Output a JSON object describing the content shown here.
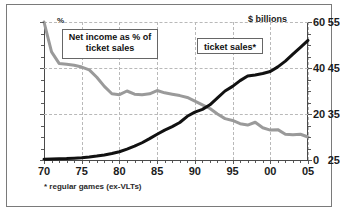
{
  "chart_data": {
    "type": "line",
    "title": "",
    "xlabel": "",
    "ylabel": "%",
    "y2label": "$ billions",
    "footnote": "* regular games (ex-VLTs)",
    "unit_left": "%",
    "unit_right": "$ billions",
    "grid": true,
    "legend_position": "inline-callouts",
    "x": [
      1970,
      1971,
      1972,
      1973,
      1974,
      1975,
      1976,
      1977,
      1978,
      1979,
      1980,
      1981,
      1982,
      1983,
      1984,
      1985,
      1986,
      1987,
      1988,
      1989,
      1990,
      1991,
      1992,
      1993,
      1994,
      1995,
      1996,
      1997,
      1998,
      1999,
      2000,
      2001,
      2002,
      2003,
      2004,
      2005
    ],
    "xtick_values": [
      1970,
      1975,
      1980,
      1985,
      1990,
      1995,
      2000,
      2005
    ],
    "xtick_labels": [
      "70",
      "75",
      "80",
      "85",
      "90",
      "95",
      "00",
      "05"
    ],
    "ylim": [
      25,
      55
    ],
    "ytick_values": [
      25,
      35,
      45,
      55
    ],
    "ytick_labels": [
      "25",
      "35",
      "45",
      "55"
    ],
    "y2lim": [
      0,
      60
    ],
    "y2tick_values": [
      0,
      20,
      40,
      60
    ],
    "y2tick_labels": [
      "0",
      "20",
      "40",
      "60"
    ],
    "series": [
      {
        "name": "Net income as % of ticket sales",
        "axis": "left",
        "color": "#9a9a9a",
        "label": "Net income as % of\nticket sales",
        "values": [
          55.0,
          48.5,
          46.0,
          45.8,
          45.6,
          45.2,
          44.6,
          43.0,
          41.0,
          39.4,
          39.2,
          40.0,
          39.3,
          39.2,
          39.4,
          40.1,
          39.6,
          39.3,
          39.0,
          38.6,
          37.8,
          37.0,
          36.2,
          35.0,
          34.0,
          33.6,
          32.9,
          32.6,
          33.2,
          32.0,
          31.5,
          31.6,
          30.6,
          30.5,
          30.6,
          30.0
        ]
      },
      {
        "name": "ticket sales*",
        "axis": "right",
        "color": "#111111",
        "label": "ticket sales*",
        "values": [
          0.3,
          0.4,
          0.5,
          0.6,
          0.8,
          1.0,
          1.3,
          1.7,
          2.2,
          2.8,
          3.6,
          4.7,
          6.0,
          7.5,
          9.3,
          11.2,
          13.0,
          14.5,
          16.3,
          19.0,
          20.8,
          22.0,
          24.0,
          27.0,
          30.0,
          32.0,
          34.5,
          36.5,
          37.0,
          37.6,
          38.5,
          40.5,
          43.0,
          46.0,
          49.0,
          52.0
        ]
      }
    ],
    "callouts": [
      {
        "id": "net",
        "line1": "Net income as % of",
        "line2": "ticket sales"
      },
      {
        "id": "ticket",
        "line1": "ticket sales*",
        "line2": ""
      }
    ]
  }
}
